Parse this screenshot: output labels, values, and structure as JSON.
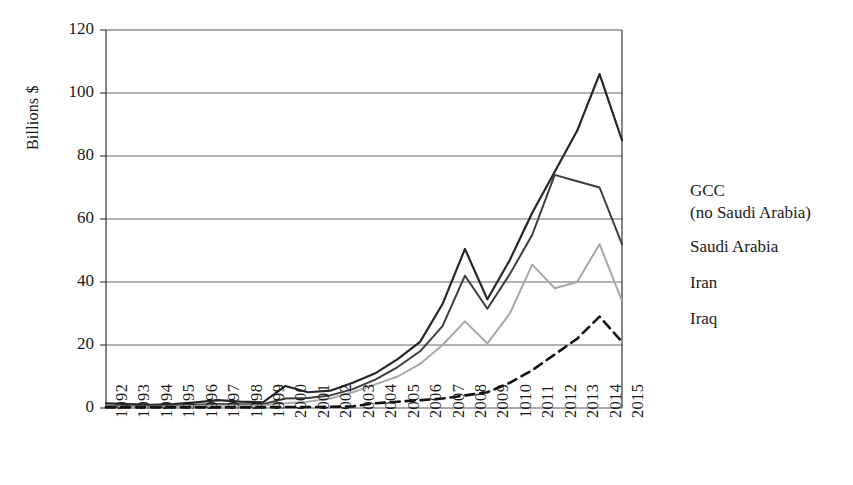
{
  "chart_data": {
    "type": "line",
    "title": "",
    "xlabel": "",
    "ylabel": "Billions $",
    "ylim": [
      0,
      120
    ],
    "yticks": [
      0,
      20,
      40,
      60,
      80,
      100,
      120
    ],
    "ytick_labels": [
      "0",
      "20",
      "40",
      "60",
      "80",
      "100",
      "120"
    ],
    "grid": true,
    "legend_position": "right",
    "categories": [
      "1992",
      "1993",
      "1994",
      "1995",
      "1996",
      "1997",
      "1998",
      "1999",
      "2000",
      "2001",
      "2002",
      "2003",
      "2004",
      "2005",
      "2006",
      "2007",
      "2008",
      "2009",
      "1010",
      "2011",
      "2012",
      "2013",
      "2014",
      "2015"
    ],
    "series": [
      {
        "name": "GCC\n(no Saudi Arabia)",
        "legend_label": "GCC\n(no Saudi Arabia)",
        "color": "#262626",
        "width": 2.2,
        "dash": "none",
        "values": [
          1.5,
          1.2,
          1.0,
          1.2,
          1.8,
          2.5,
          2.0,
          1.8,
          7.0,
          5.0,
          5.5,
          8.0,
          11.0,
          15.5,
          21.0,
          33.0,
          50.5,
          34.5,
          47.0,
          62.0,
          75.0,
          88.0,
          106.0,
          85.0
        ]
      },
      {
        "name": "Saudi Arabia",
        "legend_label": "Saudi Arabia",
        "color": "#3d3d3d",
        "width": 2.0,
        "dash": "none",
        "values": [
          0.8,
          0.7,
          0.6,
          0.8,
          1.0,
          1.3,
          1.2,
          1.2,
          3.0,
          3.2,
          4.0,
          6.0,
          9.0,
          13.0,
          18.0,
          26.0,
          42.0,
          31.5,
          42.5,
          55.0,
          74.0,
          72.0,
          70.0,
          52.0
        ]
      },
      {
        "name": "Iran",
        "legend_label": "Iran",
        "color": "#a8a8a8",
        "width": 2.0,
        "dash": "none",
        "values": [
          0.5,
          0.4,
          0.4,
          0.5,
          0.6,
          0.8,
          0.8,
          0.8,
          1.5,
          2.0,
          3.0,
          5.0,
          7.5,
          10.0,
          14.0,
          20.0,
          27.5,
          20.5,
          30.0,
          45.5,
          38.0,
          40.0,
          52.0,
          34.0
        ]
      },
      {
        "name": "Iraq",
        "legend_label": "Iraq",
        "color": "#111111",
        "width": 2.6,
        "dash": "9,6",
        "values": [
          0.2,
          0.2,
          0.2,
          0.2,
          0.2,
          0.2,
          0.2,
          0.2,
          0.3,
          0.3,
          0.4,
          0.5,
          1.5,
          2.0,
          2.5,
          3.0,
          4.0,
          5.0,
          8.0,
          12.0,
          17.0,
          22.0,
          29.0,
          21.0
        ]
      }
    ]
  },
  "axes": {
    "y_axis_title": "Billions $"
  }
}
